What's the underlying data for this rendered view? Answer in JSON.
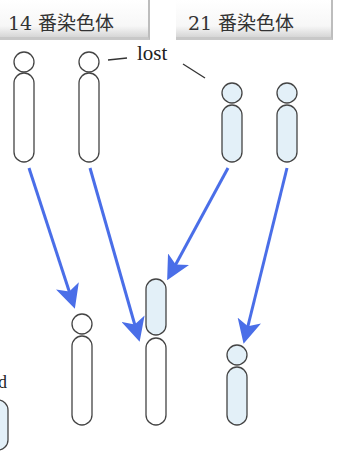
{
  "header": {
    "labels": [
      {
        "text": "14 番染色体"
      },
      {
        "text": "21 番染色体"
      }
    ]
  },
  "annotation": {
    "lost_label": "lost",
    "cut_off_text": "d"
  },
  "colors": {
    "arrow": "#4a6ee8",
    "outline": "#444444",
    "fill_21": "#e3f0f8",
    "fill_14": "#ffffff"
  },
  "chromosomes": {
    "initial": [
      {
        "group": "14",
        "fill": "white"
      },
      {
        "group": "14",
        "fill": "white"
      },
      {
        "group": "21",
        "fill": "blue"
      },
      {
        "group": "21",
        "fill": "blue"
      }
    ],
    "result": [
      {
        "type": "normal-14"
      },
      {
        "type": "fused-14-21"
      },
      {
        "type": "normal-21"
      }
    ]
  }
}
